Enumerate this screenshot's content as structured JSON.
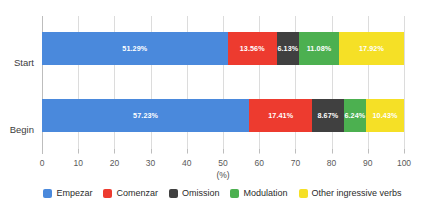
{
  "chart_data": {
    "type": "bar",
    "orientation": "horizontal",
    "stacked": true,
    "normalized": true,
    "title": "",
    "subtitle": "",
    "xlabel": "(%)",
    "ylabel": "",
    "xlim": [
      0,
      100
    ],
    "xticks": [
      "0",
      "10",
      "20",
      "30",
      "40",
      "50",
      "60",
      "70",
      "80",
      "90",
      "100"
    ],
    "xtick_values": [
      0,
      10,
      20,
      30,
      40,
      50,
      60,
      70,
      80,
      90,
      100
    ],
    "grid": true,
    "grid_axis": "x",
    "legend_position": "bottom",
    "categories": [
      "Start",
      "Begin"
    ],
    "series": [
      {
        "name": "Empezar",
        "color": "#4a89dc",
        "values": [
          51.29,
          57.23
        ],
        "labels": [
          "51.29%",
          "57.23%"
        ]
      },
      {
        "name": "Comenzar",
        "color": "#ed3b2f",
        "values": [
          13.56,
          17.41
        ],
        "labels": [
          "13.56%",
          "17.41%"
        ]
      },
      {
        "name": "Omission",
        "color": "#404040",
        "values": [
          6.13,
          8.67
        ],
        "labels": [
          "6.13%",
          "8.67%"
        ]
      },
      {
        "name": "Modulation",
        "color": "#4cb050",
        "values": [
          11.08,
          6.24
        ],
        "labels": [
          "11.08%",
          "6.24%"
        ]
      },
      {
        "name": "Other ingressive verbs",
        "color": "#f5e026",
        "values": [
          17.92,
          10.43
        ],
        "labels": [
          "17.92%",
          "10.43%"
        ]
      }
    ]
  },
  "axis": {
    "x_title": "(%)",
    "ticks": [
      "0",
      "10",
      "20",
      "30",
      "40",
      "50",
      "60",
      "70",
      "80",
      "90",
      "100"
    ]
  },
  "categories": [
    {
      "label": "Start"
    },
    {
      "label": "Begin"
    }
  ],
  "legend": {
    "items": [
      {
        "label": "Empezar",
        "color": "#4a89dc"
      },
      {
        "label": "Comenzar",
        "color": "#ed3b2f"
      },
      {
        "label": "Omission",
        "color": "#404040"
      },
      {
        "label": "Modulation",
        "color": "#4cb050"
      },
      {
        "label": "Other ingressive verbs",
        "color": "#f5e026"
      }
    ]
  },
  "colors": {
    "empezar": "#4a89dc",
    "comenzar": "#ed3b2f",
    "omission": "#404040",
    "modulation": "#4cb050",
    "other": "#f5e026",
    "grid": "#dcdcdc",
    "axis": "#bdbdbd",
    "text": "#3c3c3c",
    "background": "#ffffff"
  }
}
